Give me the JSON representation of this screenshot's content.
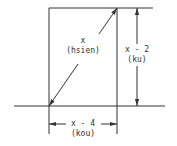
{
  "diagram": {
    "type": "right-triangle-in-rectangle",
    "hypotenuse": {
      "expr": "x",
      "name": "(hsien)"
    },
    "height": {
      "expr": "x - 2",
      "name": "(ku)"
    },
    "base": {
      "expr": "x - 4",
      "name": "(kou)"
    },
    "colors": {
      "line": "#333333",
      "background": "#ffffff"
    }
  }
}
